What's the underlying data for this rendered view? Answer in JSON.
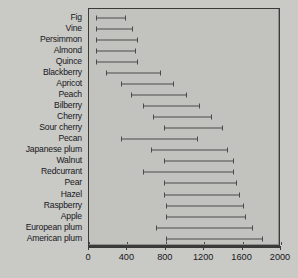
{
  "chart_data": {
    "type": "bar",
    "subtype": "range-interval",
    "title": "",
    "xlabel": "",
    "ylabel": "",
    "xlim": [
      0,
      2000
    ],
    "ylim": null,
    "grid": false,
    "legend": null,
    "xticks": [
      0,
      400,
      800,
      1200,
      1600,
      2000
    ],
    "xtick_labels": [
      "0",
      "400",
      "800",
      "1200",
      "1600",
      "2000"
    ],
    "categories": [
      "Fig",
      "Vine",
      "Persimmon",
      "Almond",
      "Quince",
      "Blackberry",
      "Apricot",
      "Peach",
      "Bilberry",
      "Cherry",
      "Sour cherry",
      "Pecan",
      "Japanese plum",
      "Walnut",
      "Redcurrant",
      "Pear",
      "Hazel",
      "Raspberry",
      "Apple",
      "European plum",
      "American plum"
    ],
    "series": [
      {
        "name": "range",
        "type": "interval",
        "start_values": [
          70,
          70,
          70,
          70,
          70,
          180,
          330,
          440,
          560,
          670,
          780,
          330,
          650,
          780,
          560,
          780,
          780,
          800,
          800,
          700,
          800
        ],
        "end_values": [
          380,
          450,
          500,
          480,
          500,
          740,
          870,
          1010,
          1150,
          1270,
          1390,
          1120,
          1440,
          1500,
          1500,
          1530,
          1560,
          1600,
          1620,
          1700,
          1800
        ]
      }
    ],
    "colors": {
      "background": "#c9c9c6",
      "plot_background": "#c2c2bf",
      "bar": "#4a4a4c",
      "axis": "#3a3a38",
      "text": "#17171a"
    }
  }
}
